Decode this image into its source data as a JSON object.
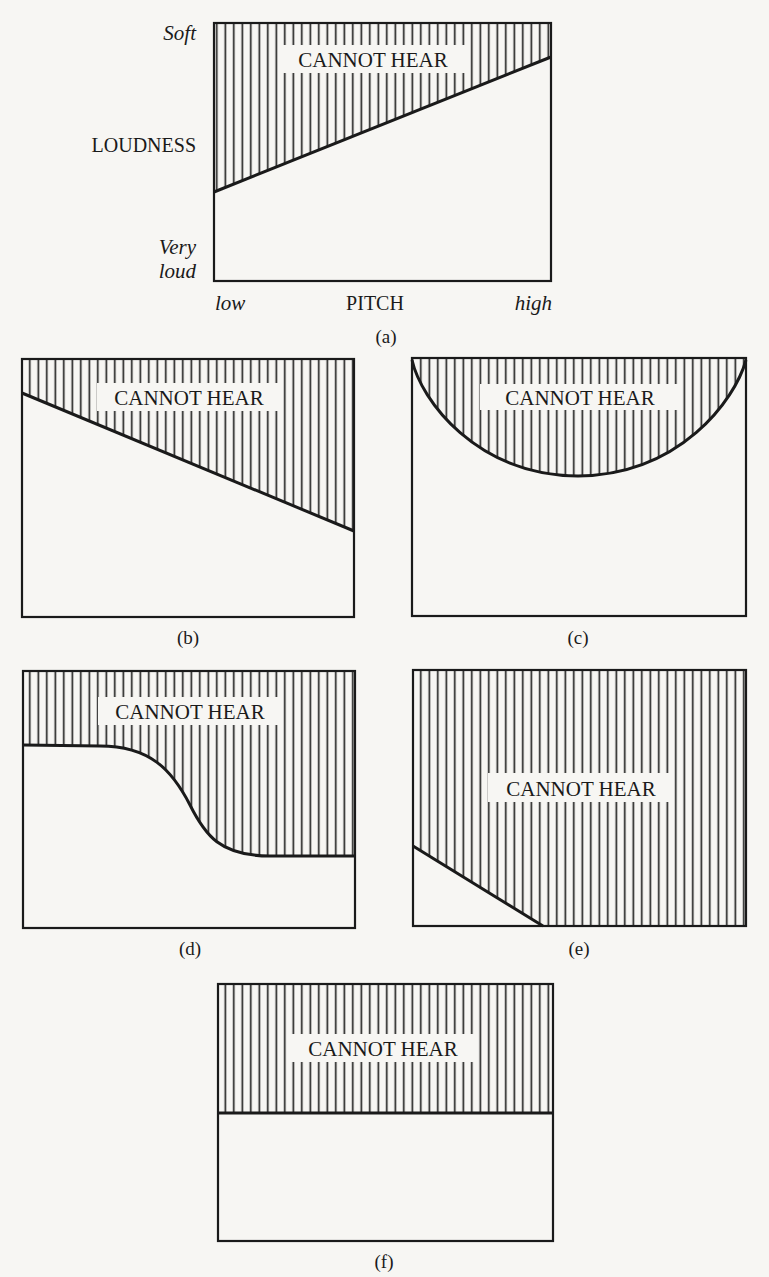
{
  "figure": {
    "region_label": "CANNOT HEAR",
    "colors": {
      "background": "#f7f6f3",
      "ink": "#1a1a1a"
    },
    "axes": {
      "y_title": "LOUDNESS",
      "y_top": "Soft",
      "y_bottom_1": "Very",
      "y_bottom_2": "loud",
      "x_title": "PITCH",
      "x_left": "low",
      "x_right": "high"
    },
    "panels": [
      {
        "id": "a",
        "caption": "(a)",
        "boundary": "line rising from low pitch (loud threshold) to high pitch (softer threshold)"
      },
      {
        "id": "b",
        "caption": "(b)",
        "boundary": "line falling from low pitch (soft threshold) to high pitch (louder threshold)"
      },
      {
        "id": "c",
        "caption": "(c)",
        "boundary": "U-shaped curve, best hearing at mid pitch"
      },
      {
        "id": "d",
        "caption": "(d)",
        "boundary": "sigmoid step: high at low pitch, drops to lower plateau at high pitch"
      },
      {
        "id": "e",
        "caption": "(e)",
        "boundary": "short falling line in lower-left corner; nearly everything cannot be heard"
      },
      {
        "id": "f",
        "caption": "(f)",
        "boundary": "flat horizontal line, threshold independent of pitch"
      }
    ]
  }
}
